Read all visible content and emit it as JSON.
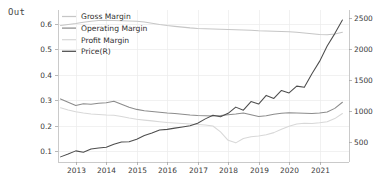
{
  "notebook": {
    "out_prompt": "Out"
  },
  "chart_data": {
    "type": "line",
    "title": "",
    "xlabel": "",
    "ylabel": "",
    "grid": true,
    "legend_position": "upper left",
    "x": [
      2012.5,
      2012.75,
      2013.0,
      2013.25,
      2013.5,
      2013.75,
      2014.0,
      2014.25,
      2014.5,
      2014.75,
      2015.0,
      2015.25,
      2015.5,
      2015.75,
      2016.0,
      2016.25,
      2016.5,
      2016.75,
      2017.0,
      2017.25,
      2017.5,
      2017.75,
      2018.0,
      2018.25,
      2018.5,
      2018.75,
      2019.0,
      2019.25,
      2019.5,
      2019.75,
      2020.0,
      2020.25,
      2020.5,
      2020.75,
      2021.0,
      2021.25,
      2021.5,
      2021.75
    ],
    "x_tick_labels": [
      "2013",
      "2014",
      "2015",
      "2016",
      "2017",
      "2018",
      "2019",
      "2020",
      "2021"
    ],
    "x_ticks": [
      2013,
      2014,
      2015,
      2016,
      2017,
      2018,
      2019,
      2020,
      2021
    ],
    "xlim": [
      2012.4,
      2021.95
    ],
    "left_axis": {
      "tick_labels": [
        "0.1",
        "0.2",
        "0.3",
        "0.4",
        "0.5",
        "0.6"
      ],
      "ticks": [
        0.1,
        0.2,
        0.3,
        0.4,
        0.5,
        0.6
      ],
      "ylim": [
        0.06,
        0.655
      ]
    },
    "right_axis": {
      "tick_labels": [
        "500",
        "1000",
        "1500",
        "2000",
        "2500"
      ],
      "ticks": [
        500,
        1000,
        1500,
        2000,
        2500
      ],
      "ylim": [
        180,
        2640
      ]
    },
    "series": [
      {
        "name": "Gross Margin",
        "axis": "left",
        "color": "#c6c6c6",
        "values": [
          0.592,
          0.596,
          0.6,
          0.605,
          0.609,
          0.612,
          0.613,
          0.612,
          0.611,
          0.61,
          0.609,
          0.606,
          0.601,
          0.596,
          0.592,
          0.589,
          0.586,
          0.583,
          0.581,
          0.58,
          0.579,
          0.578,
          0.577,
          0.576,
          0.575,
          0.574,
          0.572,
          0.571,
          0.57,
          0.569,
          0.568,
          0.566,
          0.563,
          0.56,
          0.557,
          0.556,
          0.559,
          0.566
        ]
      },
      {
        "name": "Operating Margin",
        "axis": "left",
        "color": "#8c8c8c",
        "values": [
          0.305,
          0.292,
          0.279,
          0.286,
          0.284,
          0.288,
          0.29,
          0.296,
          0.284,
          0.272,
          0.264,
          0.259,
          0.256,
          0.253,
          0.25,
          0.248,
          0.245,
          0.242,
          0.24,
          0.239,
          0.238,
          0.24,
          0.243,
          0.246,
          0.25,
          0.243,
          0.236,
          0.239,
          0.245,
          0.249,
          0.251,
          0.25,
          0.249,
          0.248,
          0.25,
          0.254,
          0.268,
          0.292
        ]
      },
      {
        "name": "Profit Margin",
        "axis": "left",
        "color": "#d8d8d8",
        "values": [
          0.27,
          0.262,
          0.255,
          0.25,
          0.246,
          0.244,
          0.242,
          0.241,
          0.236,
          0.23,
          0.225,
          0.222,
          0.219,
          0.216,
          0.213,
          0.211,
          0.209,
          0.207,
          0.205,
          0.203,
          0.199,
          0.176,
          0.143,
          0.133,
          0.15,
          0.157,
          0.16,
          0.165,
          0.173,
          0.186,
          0.198,
          0.207,
          0.21,
          0.209,
          0.212,
          0.216,
          0.228,
          0.248
        ]
      },
      {
        "name": "Price(R)",
        "axis": "right",
        "color": "#4d4d4d",
        "values": [
          255,
          300,
          352,
          330,
          383,
          400,
          412,
          460,
          495,
          500,
          540,
          600,
          640,
          690,
          700,
          720,
          740,
          760,
          800,
          870,
          930,
          905,
          960,
          1060,
          1010,
          1150,
          1110,
          1250,
          1200,
          1330,
          1290,
          1400,
          1380,
          1600,
          1800,
          2050,
          2250,
          2470
        ]
      }
    ]
  }
}
